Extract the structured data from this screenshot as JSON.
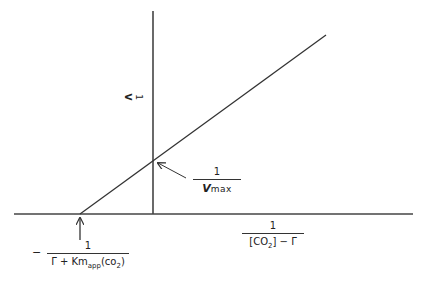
{
  "figure": {
    "type": "Lineweaver-Burk style double-reciprocal plot",
    "y_axis_label": {
      "numerator": "1",
      "denominator": "V",
      "orientation": "rotated 90°"
    },
    "x_axis_label": {
      "numerator": "1",
      "denominator_parts": [
        "[CO",
        "2",
        "] − Γ"
      ]
    },
    "y_intercept_label": {
      "numerator": "1",
      "denominator_v": "V",
      "denominator_rest": "max"
    },
    "x_intercept_label": {
      "sign": "−",
      "numerator": "1",
      "denominator_parts": [
        "Γ + Km",
        "app",
        "(co",
        "2",
        ")"
      ]
    },
    "colors": {
      "line": "#333333",
      "background": "#ffffff"
    }
  },
  "geometry": {
    "x_axis": {
      "x1": 14,
      "y1": 214,
      "x2": 413,
      "y2": 214
    },
    "y_axis": {
      "x1": 153,
      "y1": 11,
      "x2": 153,
      "y2": 214
    },
    "data_line": {
      "x1": 80,
      "y1": 214,
      "x2": 326,
      "y2": 35
    },
    "y_intercept_point": {
      "x": 153,
      "y": 161
    },
    "x_intercept_point": {
      "x": 80,
      "y": 214
    },
    "vmax_arrow": {
      "x1": 186,
      "y1": 178,
      "x2": 158,
      "y2": 163
    },
    "km_arrow": {
      "x1": 80,
      "y1": 240,
      "x2": 80,
      "y2": 217
    }
  }
}
